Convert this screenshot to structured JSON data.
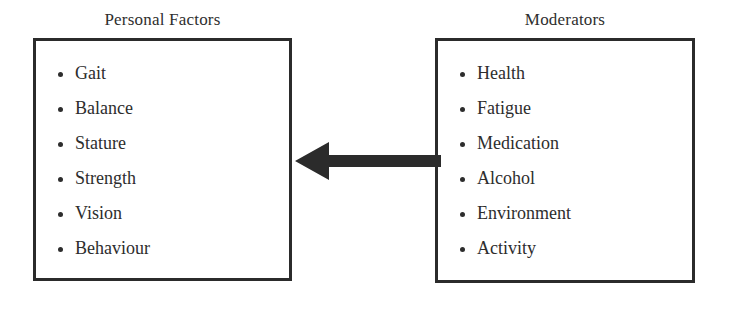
{
  "diagram": {
    "title_personal": "Personal Factors",
    "title_moderators": "Moderators",
    "arrow_name": "arrow-left",
    "arrow_direction": "right-to-left",
    "ink_color": "#2b2b2b",
    "background_color": "#ffffff"
  },
  "personal_factors": {
    "heading": "Personal Factors",
    "items": [
      {
        "label": "Gait"
      },
      {
        "label": "Balance"
      },
      {
        "label": "Stature"
      },
      {
        "label": "Strength"
      },
      {
        "label": "Vision"
      },
      {
        "label": "Behaviour"
      }
    ]
  },
  "moderators": {
    "heading": "Moderators",
    "items": [
      {
        "label": "Health"
      },
      {
        "label": "Fatigue"
      },
      {
        "label": "Medication"
      },
      {
        "label": "Alcohol"
      },
      {
        "label": "Environment"
      },
      {
        "label": "Activity"
      }
    ]
  }
}
